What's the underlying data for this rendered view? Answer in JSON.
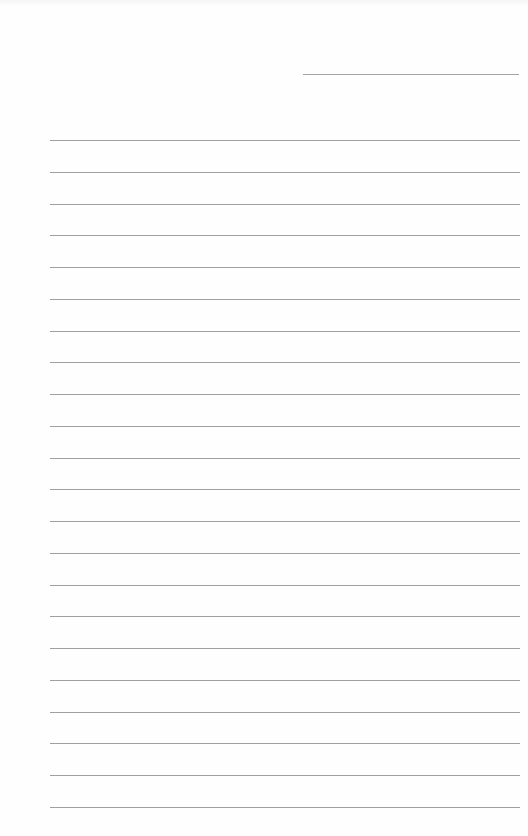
{
  "document": {
    "type": "lined-paper",
    "background_color": "#fefefe",
    "line_color": "#a0a0a0",
    "header_line": {
      "label": "",
      "x": 303,
      "y": 74,
      "width": 216
    },
    "ruled_lines": {
      "count": 22,
      "first_y": 140,
      "spacing": 31.75,
      "x": 50,
      "width": 470
    }
  }
}
